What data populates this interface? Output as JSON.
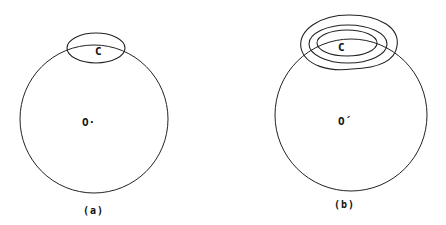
{
  "figure": {
    "panels": [
      {
        "id": "a",
        "caption": "(a)",
        "center_label": "O·",
        "cap_label": "C",
        "loops": 1
      },
      {
        "id": "b",
        "caption": "(b)",
        "center_label": "O´",
        "cap_label": "C",
        "loops": 3
      }
    ],
    "stroke_color": "#222222"
  }
}
